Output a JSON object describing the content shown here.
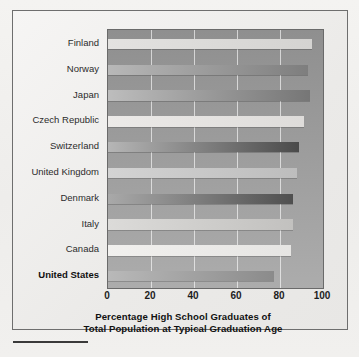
{
  "chart_data": {
    "type": "bar",
    "orientation": "horizontal",
    "title": "",
    "axis_title_lines": [
      "Percentage High School Graduates of",
      "Total Population at Typical Graduation Age"
    ],
    "xlabel": "Percentage High School Graduates of Total Population at Typical Graduation Age",
    "ylabel": "",
    "xlim": [
      0,
      100
    ],
    "xticks": [
      "0",
      "20",
      "40",
      "60",
      "80",
      "100"
    ],
    "xtick_values": [
      0,
      20,
      40,
      60,
      80,
      100
    ],
    "grid": "vertical gridlines at 20, 40, 60, 80",
    "legend": "none",
    "categories": [
      "Finland",
      "Norway",
      "Japan",
      "Czech Republic",
      "Switzerland",
      "United Kingdom",
      "Denmark",
      "Italy",
      "Canada",
      "United States"
    ],
    "values": [
      95,
      93,
      94,
      91,
      89,
      88,
      86,
      86,
      85,
      77
    ],
    "bars": [
      {
        "label": "Finland",
        "value": 95,
        "fill_from": "#e3e2e0",
        "fill_to": "#d4d3d1",
        "emphasis": false
      },
      {
        "label": "Norway",
        "value": 93,
        "fill_from": "#b8b8b8",
        "fill_to": "#7e7e7e",
        "emphasis": false
      },
      {
        "label": "Japan",
        "value": 94,
        "fill_from": "#bdbdbd",
        "fill_to": "#767676",
        "emphasis": false
      },
      {
        "label": "Czech Republic",
        "value": 91,
        "fill_from": "#eceae8",
        "fill_to": "#dedcda",
        "emphasis": false
      },
      {
        "label": "Switzerland",
        "value": 89,
        "fill_from": "#b6b6b6",
        "fill_to": "#4a4a4a",
        "emphasis": false
      },
      {
        "label": "United Kingdom",
        "value": 88,
        "fill_from": "#d3d3d3",
        "fill_to": "#bdbdbd",
        "emphasis": false
      },
      {
        "label": "Denmark",
        "value": 86,
        "fill_from": "#a9a9a9",
        "fill_to": "#4f4f4f",
        "emphasis": false
      },
      {
        "label": "Italy",
        "value": 86,
        "fill_from": "#dcdbd9",
        "fill_to": "#c2c1bf",
        "emphasis": false
      },
      {
        "label": "Canada",
        "value": 85,
        "fill_from": "#f1f0ee",
        "fill_to": "#e6e5e3",
        "emphasis": false
      },
      {
        "label": "United States",
        "value": 77,
        "fill_from": "#b9b9b9",
        "fill_to": "#8b8b8b",
        "emphasis": true
      }
    ],
    "colors": {
      "plot_background": "#9c9c9c",
      "frame_border": "#6e6e6e",
      "page_background": "#f1f0ee",
      "gridline": "#ffffff",
      "text": "#1d1d1d"
    }
  }
}
